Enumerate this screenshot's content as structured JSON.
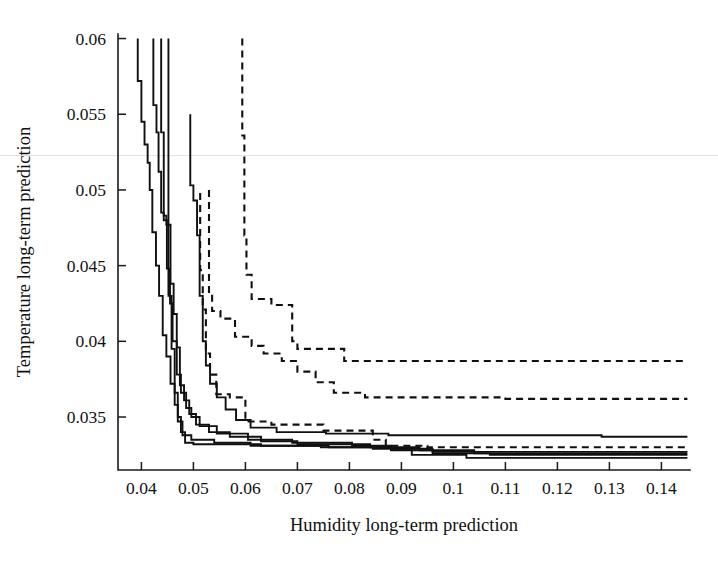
{
  "figure": {
    "title": "",
    "background_color": "#ffffff",
    "line_color": "#101010"
  },
  "chart_data": {
    "type": "line",
    "title": "",
    "subtitle": "",
    "xlabel": "Humidity long-term prediction",
    "ylabel": "Temperature long-term prediction",
    "xlim": [
      0.0355,
      0.1455
    ],
    "ylim": [
      0.0315,
      0.0603
    ],
    "xticks": [
      0.04,
      0.05,
      0.06,
      0.07,
      0.08,
      0.09,
      0.1,
      0.11,
      0.12,
      0.13,
      0.14
    ],
    "xtick_labels": [
      "0.04",
      "0.05",
      "0.06",
      "0.07",
      "0.08",
      "0.09",
      "0.1",
      "0.11",
      "0.12",
      "0.13",
      "0.14"
    ],
    "yticks": [
      0.035,
      0.04,
      0.045,
      0.05,
      0.055,
      0.06
    ],
    "ytick_labels": [
      "0.035",
      "0.04",
      "0.045",
      "0.05",
      "0.055",
      "0.06"
    ],
    "grid": false,
    "legend": null,
    "legend_position": "none",
    "annotations": [],
    "series": [
      {
        "name": "solid-1",
        "style": "solid",
        "points": [
          [
            0.0393,
            0.06
          ],
          [
            0.0393,
            0.0572
          ],
          [
            0.04,
            0.0572
          ],
          [
            0.04,
            0.0545
          ],
          [
            0.0406,
            0.0545
          ],
          [
            0.0406,
            0.053
          ],
          [
            0.0412,
            0.053
          ],
          [
            0.0412,
            0.0518
          ],
          [
            0.0416,
            0.0518
          ],
          [
            0.0416,
            0.05
          ],
          [
            0.0421,
            0.05
          ],
          [
            0.0421,
            0.0472
          ],
          [
            0.0428,
            0.0472
          ],
          [
            0.0428,
            0.045
          ],
          [
            0.0434,
            0.045
          ],
          [
            0.0434,
            0.043
          ],
          [
            0.0441,
            0.043
          ],
          [
            0.0441,
            0.0404
          ],
          [
            0.0448,
            0.0404
          ],
          [
            0.0448,
            0.039
          ],
          [
            0.0456,
            0.039
          ],
          [
            0.0456,
            0.0372
          ],
          [
            0.0464,
            0.0372
          ],
          [
            0.0464,
            0.0358
          ],
          [
            0.047,
            0.0358
          ],
          [
            0.047,
            0.0347
          ],
          [
            0.0479,
            0.0347
          ],
          [
            0.0479,
            0.0338
          ],
          [
            0.0496,
            0.0338
          ],
          [
            0.0496,
            0.0335
          ],
          [
            0.054,
            0.0335
          ],
          [
            0.054,
            0.0333
          ],
          [
            0.061,
            0.0333
          ],
          [
            0.061,
            0.0331
          ],
          [
            0.0745,
            0.0331
          ],
          [
            0.0745,
            0.033
          ],
          [
            0.088,
            0.033
          ],
          [
            0.088,
            0.0328
          ],
          [
            0.096,
            0.0328
          ],
          [
            0.096,
            0.0326
          ],
          [
            0.107,
            0.0326
          ],
          [
            0.107,
            0.0325
          ],
          [
            0.145,
            0.0325
          ]
        ]
      },
      {
        "name": "solid-2",
        "style": "solid",
        "points": [
          [
            0.0423,
            0.06
          ],
          [
            0.0423,
            0.0556
          ],
          [
            0.0429,
            0.0556
          ],
          [
            0.0429,
            0.0538
          ],
          [
            0.0433,
            0.0538
          ],
          [
            0.0433,
            0.0512
          ],
          [
            0.0438,
            0.0512
          ],
          [
            0.0438,
            0.0485
          ],
          [
            0.0443,
            0.0485
          ],
          [
            0.0443,
            0.048
          ],
          [
            0.0449,
            0.048
          ],
          [
            0.0449,
            0.0448
          ],
          [
            0.0455,
            0.0448
          ],
          [
            0.0455,
            0.0425
          ],
          [
            0.046,
            0.0425
          ],
          [
            0.046,
            0.04
          ],
          [
            0.0468,
            0.04
          ],
          [
            0.0468,
            0.0378
          ],
          [
            0.0476,
            0.0378
          ],
          [
            0.0476,
            0.0366
          ],
          [
            0.0486,
            0.0366
          ],
          [
            0.0486,
            0.0356
          ],
          [
            0.0496,
            0.0356
          ],
          [
            0.0496,
            0.035
          ],
          [
            0.0512,
            0.035
          ],
          [
            0.0512,
            0.0344
          ],
          [
            0.0545,
            0.0344
          ],
          [
            0.0545,
            0.0339
          ],
          [
            0.0605,
            0.0339
          ],
          [
            0.0605,
            0.0335
          ],
          [
            0.069,
            0.0335
          ],
          [
            0.069,
            0.0333
          ],
          [
            0.0805,
            0.0333
          ],
          [
            0.0805,
            0.0331
          ],
          [
            0.088,
            0.0331
          ],
          [
            0.088,
            0.0329
          ],
          [
            0.096,
            0.0329
          ],
          [
            0.096,
            0.0327
          ],
          [
            0.145,
            0.0327
          ]
        ]
      },
      {
        "name": "solid-3",
        "style": "solid",
        "points": [
          [
            0.0438,
            0.06
          ],
          [
            0.0438,
            0.0538
          ],
          [
            0.0443,
            0.0538
          ],
          [
            0.0443,
            0.0483
          ],
          [
            0.0448,
            0.0483
          ],
          [
            0.0448,
            0.0477
          ],
          [
            0.0456,
            0.0477
          ],
          [
            0.0456,
            0.0438
          ],
          [
            0.0462,
            0.0438
          ],
          [
            0.0462,
            0.0418
          ],
          [
            0.0468,
            0.0418
          ],
          [
            0.0468,
            0.0396
          ],
          [
            0.0474,
            0.0396
          ],
          [
            0.0474,
            0.0371
          ],
          [
            0.0482,
            0.0371
          ],
          [
            0.0482,
            0.0361
          ],
          [
            0.0492,
            0.0361
          ],
          [
            0.0492,
            0.0352
          ],
          [
            0.0505,
            0.0352
          ],
          [
            0.0505,
            0.0345
          ],
          [
            0.053,
            0.0345
          ],
          [
            0.053,
            0.034
          ],
          [
            0.057,
            0.034
          ],
          [
            0.057,
            0.0337
          ],
          [
            0.063,
            0.0337
          ],
          [
            0.063,
            0.0334
          ],
          [
            0.07,
            0.0334
          ],
          [
            0.07,
            0.0332
          ],
          [
            0.084,
            0.0332
          ],
          [
            0.084,
            0.033
          ],
          [
            0.0935,
            0.033
          ],
          [
            0.0935,
            0.0328
          ],
          [
            0.104,
            0.0328
          ],
          [
            0.104,
            0.0326
          ],
          [
            0.145,
            0.0326
          ]
        ]
      },
      {
        "name": "solid-4",
        "style": "solid",
        "points": [
          [
            0.0494,
            0.055
          ],
          [
            0.0494,
            0.0503
          ],
          [
            0.05,
            0.0503
          ],
          [
            0.05,
            0.0493
          ],
          [
            0.0507,
            0.0493
          ],
          [
            0.0507,
            0.047
          ],
          [
            0.0512,
            0.047
          ],
          [
            0.0512,
            0.043
          ],
          [
            0.0518,
            0.043
          ],
          [
            0.0518,
            0.04
          ],
          [
            0.0524,
            0.04
          ],
          [
            0.0524,
            0.0384
          ],
          [
            0.0532,
            0.0384
          ],
          [
            0.0532,
            0.0372
          ],
          [
            0.0545,
            0.0372
          ],
          [
            0.0545,
            0.0363
          ],
          [
            0.0562,
            0.0363
          ],
          [
            0.0562,
            0.0355
          ],
          [
            0.0582,
            0.0355
          ],
          [
            0.0582,
            0.0348
          ],
          [
            0.061,
            0.0348
          ],
          [
            0.061,
            0.0343
          ],
          [
            0.066,
            0.0343
          ],
          [
            0.066,
            0.034
          ],
          [
            0.0755,
            0.034
          ],
          [
            0.0755,
            0.0339
          ],
          [
            0.0875,
            0.0339
          ],
          [
            0.0875,
            0.0338
          ],
          [
            0.1285,
            0.0338
          ],
          [
            0.1285,
            0.0337
          ],
          [
            0.145,
            0.0337
          ]
        ]
      },
      {
        "name": "solid-5",
        "style": "solid",
        "points": [
          [
            0.0452,
            0.06
          ],
          [
            0.0452,
            0.043
          ],
          [
            0.0458,
            0.043
          ],
          [
            0.0458,
            0.0395
          ],
          [
            0.0464,
            0.0395
          ],
          [
            0.0464,
            0.0366
          ],
          [
            0.047,
            0.0366
          ],
          [
            0.047,
            0.035
          ],
          [
            0.0476,
            0.035
          ],
          [
            0.0476,
            0.034
          ],
          [
            0.0484,
            0.034
          ],
          [
            0.0484,
            0.0333
          ],
          [
            0.05,
            0.0333
          ],
          [
            0.05,
            0.0332
          ],
          [
            0.063,
            0.0332
          ],
          [
            0.063,
            0.0331
          ],
          [
            0.076,
            0.0331
          ],
          [
            0.076,
            0.033
          ],
          [
            0.0845,
            0.033
          ],
          [
            0.0845,
            0.0329
          ],
          [
            0.092,
            0.0329
          ],
          [
            0.092,
            0.0325
          ],
          [
            0.1025,
            0.0325
          ],
          [
            0.1025,
            0.0323
          ],
          [
            0.145,
            0.0323
          ]
        ]
      },
      {
        "name": "dashed-1",
        "style": "dashed",
        "points": [
          [
            0.0594,
            0.06
          ],
          [
            0.0594,
            0.0536
          ],
          [
            0.0598,
            0.0536
          ],
          [
            0.0598,
            0.047
          ],
          [
            0.0602,
            0.047
          ],
          [
            0.0602,
            0.0444
          ],
          [
            0.0612,
            0.0444
          ],
          [
            0.0612,
            0.0428
          ],
          [
            0.065,
            0.0428
          ],
          [
            0.065,
            0.0424
          ],
          [
            0.069,
            0.0424
          ],
          [
            0.069,
            0.04
          ],
          [
            0.07,
            0.04
          ],
          [
            0.07,
            0.0395
          ],
          [
            0.079,
            0.0395
          ],
          [
            0.079,
            0.0387
          ],
          [
            0.145,
            0.0387
          ]
        ]
      },
      {
        "name": "dashed-2",
        "style": "dashed",
        "points": [
          [
            0.053,
            0.05
          ],
          [
            0.053,
            0.043
          ],
          [
            0.0536,
            0.043
          ],
          [
            0.0536,
            0.042
          ],
          [
            0.0552,
            0.042
          ],
          [
            0.0552,
            0.0415
          ],
          [
            0.058,
            0.0415
          ],
          [
            0.058,
            0.0403
          ],
          [
            0.0612,
            0.0403
          ],
          [
            0.0612,
            0.0397
          ],
          [
            0.0635,
            0.0397
          ],
          [
            0.0635,
            0.0392
          ],
          [
            0.067,
            0.0392
          ],
          [
            0.067,
            0.0387
          ],
          [
            0.07,
            0.0387
          ],
          [
            0.07,
            0.038
          ],
          [
            0.0735,
            0.038
          ],
          [
            0.0735,
            0.0373
          ],
          [
            0.077,
            0.0373
          ],
          [
            0.077,
            0.0366
          ],
          [
            0.083,
            0.0366
          ],
          [
            0.083,
            0.0363
          ],
          [
            0.11,
            0.0363
          ],
          [
            0.11,
            0.0362
          ],
          [
            0.145,
            0.0362
          ]
        ]
      },
      {
        "name": "dashed-3",
        "style": "dashed",
        "points": [
          [
            0.0513,
            0.0498
          ],
          [
            0.0513,
            0.0447
          ],
          [
            0.0518,
            0.0447
          ],
          [
            0.0518,
            0.0421
          ],
          [
            0.0524,
            0.0421
          ],
          [
            0.0524,
            0.0392
          ],
          [
            0.0532,
            0.0392
          ],
          [
            0.0532,
            0.0378
          ],
          [
            0.0544,
            0.0378
          ],
          [
            0.0544,
            0.0365
          ],
          [
            0.057,
            0.0365
          ],
          [
            0.057,
            0.0363
          ],
          [
            0.06,
            0.0363
          ],
          [
            0.06,
            0.0347
          ],
          [
            0.065,
            0.0347
          ],
          [
            0.065,
            0.0345
          ],
          [
            0.075,
            0.0345
          ],
          [
            0.075,
            0.0341
          ],
          [
            0.0845,
            0.0341
          ],
          [
            0.0845,
            0.0335
          ],
          [
            0.087,
            0.0335
          ],
          [
            0.087,
            0.0331
          ],
          [
            0.095,
            0.0331
          ],
          [
            0.095,
            0.033
          ],
          [
            0.145,
            0.033
          ]
        ]
      }
    ]
  }
}
